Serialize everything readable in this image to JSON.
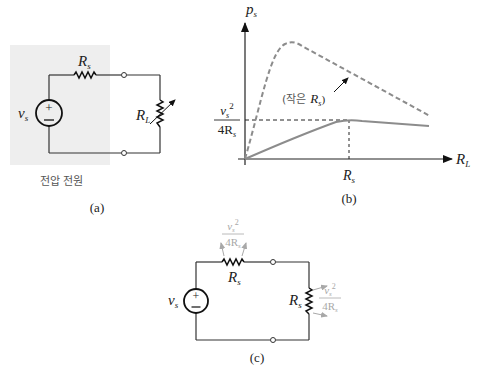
{
  "panel_a": {
    "caption": "(a)",
    "source_region_label": "전압 전원",
    "source_label": "v",
    "source_label_sub": "s",
    "series_resistor_label": "R",
    "series_resistor_sub": "s",
    "load_resistor_label": "R",
    "load_resistor_sub": "L",
    "shading_color": "#eeeeee"
  },
  "panel_b": {
    "caption": "(b)",
    "y_axis_label": "p",
    "y_axis_sub": "s",
    "x_axis_label": "R",
    "x_axis_sub": "L",
    "x_tick_label": "R",
    "x_tick_sub": "s",
    "y_tick_numerator": "v",
    "y_tick_num_sub": "s",
    "y_tick_num_exp": "2",
    "y_tick_denominator": "4R",
    "y_tick_den_sub": "s",
    "annotation_prefix": "(작은",
    "annotation_var": "R",
    "annotation_sub": "s",
    "annotation_suffix": ")",
    "curve_color": "#8c8c8c"
  },
  "panel_c": {
    "caption": "(c)",
    "source_label": "v",
    "source_label_sub": "s",
    "series_resistor_label": "R",
    "series_resistor_sub": "s",
    "load_resistor_label": "R",
    "load_resistor_sub": "s",
    "power_num": "v",
    "power_num_sub": "s",
    "power_num_exp": "2",
    "power_den": "4R",
    "power_den_sub": "s",
    "annotation_color": "#a8a8a8"
  }
}
